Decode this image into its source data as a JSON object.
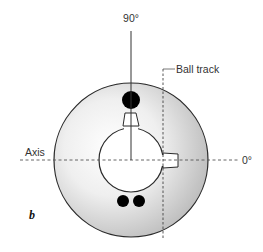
{
  "figure": {
    "panel_label": "b",
    "labels": {
      "angle_top": "90°",
      "angle_right": "0°",
      "axis": "Axis",
      "ball_track": "Ball track"
    },
    "components": {
      "ball": "bowling-ball",
      "core": "inner-core-circle",
      "thumb_hole": "thumb-hole",
      "finger_holes": [
        "finger-hole-left",
        "finger-hole-right"
      ],
      "axis_line": "horizontal-dashed-axis",
      "track_line": "vertical-dashed-ball-track",
      "reference_line": "vertical-90-degree-line"
    },
    "colors": {
      "ball_edge": "#2a2a2a",
      "ball_fill_light": "#fbfbfb",
      "ball_fill_dark": "#b8b8b8",
      "holes": "#000000",
      "dashes": "#555555"
    }
  }
}
